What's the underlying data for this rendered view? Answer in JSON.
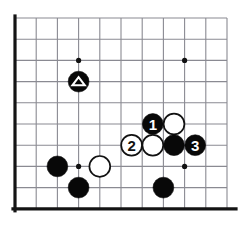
{
  "diagram": {
    "kind": "go-board-diagram",
    "board": {
      "cropped": true,
      "visible_columns": 11,
      "visible_rows": 10,
      "grid_spacing_px": 21.2,
      "origin_x_px": 15,
      "origin_y_px": 18,
      "left_edge_thick": true,
      "bottom_edge_thick": true,
      "grid_color": "#8a8a92",
      "edge_color": "#141414",
      "background_color": "#ffffff"
    },
    "star_points": [
      {
        "name": "star-point-upper-left",
        "col": 3,
        "row": 2
      },
      {
        "name": "star-point-upper-right",
        "col": 8,
        "row": 2
      },
      {
        "name": "star-point-lower-left",
        "col": 3,
        "row": 7
      },
      {
        "name": "star-point-lower-right",
        "col": 8,
        "row": 7
      }
    ],
    "stones": [
      {
        "id": "stone-triangle-black",
        "color": "black",
        "col": 3,
        "row": 3,
        "label": "",
        "marker": "triangle",
        "marker_color": "#ffffff"
      },
      {
        "id": "stone-move-1-black",
        "color": "black",
        "col": 6.5,
        "row": 5,
        "label": "1",
        "marker": "none",
        "marker_color": ""
      },
      {
        "id": "stone-white-upper-right",
        "color": "white",
        "col": 7.5,
        "row": 5,
        "label": "",
        "marker": "none",
        "marker_color": ""
      },
      {
        "id": "stone-move-2-white",
        "color": "white",
        "col": 5.5,
        "row": 6,
        "label": "2",
        "marker": "none",
        "marker_color": ""
      },
      {
        "id": "stone-white-center",
        "color": "white",
        "col": 6.5,
        "row": 6,
        "label": "",
        "marker": "none",
        "marker_color": ""
      },
      {
        "id": "stone-black-center",
        "color": "black",
        "col": 7.5,
        "row": 6,
        "label": "",
        "marker": "none",
        "marker_color": ""
      },
      {
        "id": "stone-move-3-black",
        "color": "black",
        "col": 8.5,
        "row": 6,
        "label": "3",
        "marker": "none",
        "marker_color": ""
      },
      {
        "id": "stone-black-left-lower",
        "color": "black",
        "col": 2,
        "row": 7,
        "label": "",
        "marker": "none",
        "marker_color": ""
      },
      {
        "id": "stone-white-lower-left",
        "color": "white",
        "col": 4,
        "row": 7,
        "label": "",
        "marker": "none",
        "marker_color": ""
      },
      {
        "id": "stone-black-lower-left-below",
        "color": "black",
        "col": 3,
        "row": 8,
        "label": "",
        "marker": "none",
        "marker_color": ""
      },
      {
        "id": "stone-black-lower-right",
        "color": "black",
        "col": 7,
        "row": 8,
        "label": "",
        "marker": "none",
        "marker_color": ""
      }
    ],
    "move_labels": [
      "1",
      "2",
      "3"
    ]
  }
}
